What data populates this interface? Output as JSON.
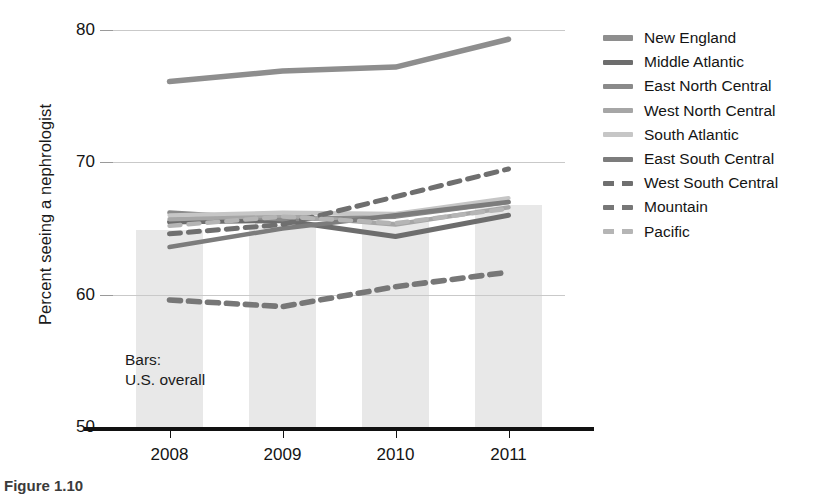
{
  "chart_data": {
    "type": "line",
    "title": "",
    "xlabel": "",
    "ylabel": "Percent seeing a nephrologist",
    "x": [
      "2008",
      "2009",
      "2010",
      "2011"
    ],
    "xlim": [
      2007.6,
      2011.5
    ],
    "ylim": [
      50,
      80
    ],
    "yticks": [
      50,
      60,
      70,
      80
    ],
    "grid": "horizontal",
    "legend_position": "right",
    "annotation": "Bars:\nU.S. overall",
    "bars": {
      "name": "U.S. overall",
      "categories": [
        "2008",
        "2009",
        "2010",
        "2011"
      ],
      "values": [
        64.9,
        65.3,
        65.6,
        66.8
      ],
      "color": "#e8e8e8"
    },
    "series": [
      {
        "name": "New England",
        "values": [
          76.1,
          76.9,
          77.2,
          79.3
        ],
        "style": "solid",
        "color": "#8e8e8e",
        "width": 5.5
      },
      {
        "name": "Middle Atlantic",
        "values": [
          65.5,
          65.6,
          64.4,
          66.0
        ],
        "style": "solid",
        "color": "#6d6d6d",
        "width": 5.0
      },
      {
        "name": "East North Central",
        "values": [
          66.2,
          65.7,
          65.9,
          67.0
        ],
        "style": "solid",
        "color": "#8a8a8a",
        "width": 4.6
      },
      {
        "name": "West North Central",
        "values": [
          65.7,
          66.0,
          65.3,
          66.6
        ],
        "style": "solid",
        "color": "#a6a6a6",
        "width": 4.4
      },
      {
        "name": "South Atlantic",
        "values": [
          66.0,
          66.2,
          66.1,
          67.3
        ],
        "style": "solid",
        "color": "#c6c6c6",
        "width": 4.2
      },
      {
        "name": "East South Central",
        "values": [
          63.6,
          65.0,
          66.0,
          67.0
        ],
        "style": "solid",
        "color": "#7c7c7c",
        "width": 4.4
      },
      {
        "name": "West South Central",
        "values": [
          64.6,
          65.3,
          67.4,
          69.5
        ],
        "style": "dashed",
        "color": "#6f6f6f",
        "width": 5.0
      },
      {
        "name": "Mountain",
        "values": [
          59.6,
          59.1,
          60.6,
          61.7
        ],
        "style": "dashed",
        "color": "#777777",
        "width": 5.6
      },
      {
        "name": "Pacific",
        "values": [
          65.2,
          65.9,
          65.4,
          66.5
        ],
        "style": "dashed",
        "color": "#b5b5b5",
        "width": 4.4
      }
    ]
  },
  "legend": {
    "items": [
      {
        "label": "New England"
      },
      {
        "label": "Middle Atlantic"
      },
      {
        "label": "East North Central"
      },
      {
        "label": "West North Central"
      },
      {
        "label": "South Atlantic"
      },
      {
        "label": "East South Central"
      },
      {
        "label": "West South Central"
      },
      {
        "label": "Mountain"
      },
      {
        "label": "Pacific"
      }
    ]
  },
  "annotation": {
    "line1": "Bars:",
    "line2": "U.S. overall"
  },
  "caption": {
    "text": "Figure 1.10"
  }
}
